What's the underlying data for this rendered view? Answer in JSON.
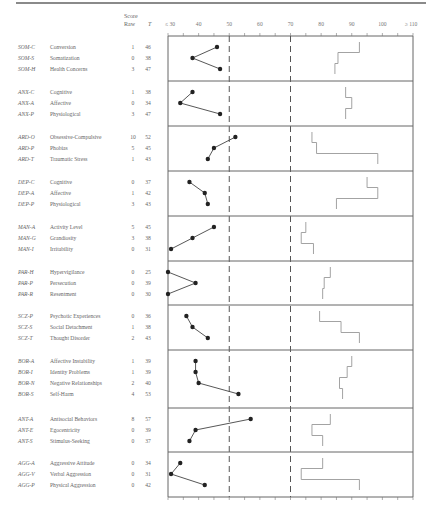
{
  "header": {
    "score_label": "Score",
    "raw_label": "Raw",
    "t_label": "T"
  },
  "axis": {
    "ticks": [
      {
        "value": 30,
        "label": "≤ 30"
      },
      {
        "value": 40,
        "label": "40"
      },
      {
        "value": 50,
        "label": "50"
      },
      {
        "value": 60,
        "label": "60"
      },
      {
        "value": 70,
        "label": "70"
      },
      {
        "value": 80,
        "label": "80"
      },
      {
        "value": 90,
        "label": "90"
      },
      {
        "value": 100,
        "label": "100"
      },
      {
        "value": 110,
        "label": "≥ 110"
      }
    ],
    "dashed_lines": [
      50,
      70
    ]
  },
  "sections": [
    {
      "rows": [
        {
          "abbr": "SOM-C",
          "name": "Conversion",
          "raw": "1",
          "t": "46",
          "ref": 92.5
        },
        {
          "abbr": "SOM-S",
          "name": "Somatization",
          "raw": "0",
          "t": "38",
          "ref": 85.5
        },
        {
          "abbr": "SOM-H",
          "name": "Health Concerns",
          "raw": "3",
          "t": "47",
          "ref": 84.5
        }
      ]
    },
    {
      "rows": [
        {
          "abbr": "ANX-C",
          "name": "Cognitive",
          "raw": "1",
          "t": "38",
          "ref": 88
        },
        {
          "abbr": "ANX-A",
          "name": "Affective",
          "raw": "0",
          "t": "34",
          "ref": 90
        },
        {
          "abbr": "ANX-P",
          "name": "Physiological",
          "raw": "3",
          "t": "47",
          "ref": 88
        }
      ]
    },
    {
      "rows": [
        {
          "abbr": "ARD-O",
          "name": "Obsessive-Compulsive",
          "raw": "10",
          "t": "52",
          "ref": 77
        },
        {
          "abbr": "ARD-P",
          "name": "Phobias",
          "raw": "5",
          "t": "45",
          "ref": 78.5
        },
        {
          "abbr": "ARD-T",
          "name": "Traumatic Stress",
          "raw": "1",
          "t": "43",
          "ref": 98.5
        }
      ]
    },
    {
      "rows": [
        {
          "abbr": "DEP-C",
          "name": "Cognitive",
          "raw": "0",
          "t": "37",
          "ref": 95
        },
        {
          "abbr": "DEP-A",
          "name": "Affective",
          "raw": "1",
          "t": "42",
          "ref": 98.5
        },
        {
          "abbr": "DEP-P",
          "name": "Physiological",
          "raw": "3",
          "t": "43",
          "ref": 85
        }
      ]
    },
    {
      "rows": [
        {
          "abbr": "MAN-A",
          "name": "Activity Level",
          "raw": "5",
          "t": "45",
          "ref": 75
        },
        {
          "abbr": "MAN-G",
          "name": "Grandiosity",
          "raw": "3",
          "t": "38",
          "ref": 73.5
        },
        {
          "abbr": "MAN-I",
          "name": "Irritability",
          "raw": "0",
          "t": "31",
          "ref": 77.5
        }
      ]
    },
    {
      "rows": [
        {
          "abbr": "PAR-H",
          "name": "Hypervigilance",
          "raw": "0",
          "t": "25",
          "ref": 83
        },
        {
          "abbr": "PAR-P",
          "name": "Persecution",
          "raw": "0",
          "t": "39",
          "ref": 81
        },
        {
          "abbr": "PAR-R",
          "name": "Resentment",
          "raw": "0",
          "t": "30",
          "ref": 80.5
        }
      ]
    },
    {
      "rows": [
        {
          "abbr": "SCZ-P",
          "name": "Psychotic Experiences",
          "raw": "0",
          "t": "36",
          "ref": 79.5
        },
        {
          "abbr": "SCZ-S",
          "name": "Social Detachment",
          "raw": "1",
          "t": "38",
          "ref": 86.5
        },
        {
          "abbr": "SCZ-T",
          "name": "Thought Disorder",
          "raw": "2",
          "t": "43",
          "ref": 92.5
        }
      ]
    },
    {
      "rows": [
        {
          "abbr": "BOR-A",
          "name": "Affective Instability",
          "raw": "1",
          "t": "39",
          "ref": 90
        },
        {
          "abbr": "BOR-I",
          "name": "Identity Problems",
          "raw": "1",
          "t": "39",
          "ref": 88.5
        },
        {
          "abbr": "BOR-N",
          "name": "Negative Relationships",
          "raw": "2",
          "t": "40",
          "ref": 86
        },
        {
          "abbr": "BOR-S",
          "name": "Self-Harm",
          "raw": "4",
          "t": "53",
          "ref": 87
        }
      ]
    },
    {
      "rows": [
        {
          "abbr": "ANT-A",
          "name": "Antisocial Behaviors",
          "raw": "8",
          "t": "57",
          "ref": 83
        },
        {
          "abbr": "ANT-E",
          "name": "Egocentricity",
          "raw": "0",
          "t": "39",
          "ref": 77
        },
        {
          "abbr": "ANT-S",
          "name": "Stimulus-Seeking",
          "raw": "0",
          "t": "37",
          "ref": 80.5
        }
      ]
    },
    {
      "rows": [
        {
          "abbr": "AGG-A",
          "name": "Aggressive Attitude",
          "raw": "0",
          "t": "34",
          "ref": 80.5
        },
        {
          "abbr": "AGG-V",
          "name": "Verbal Aggression",
          "raw": "0",
          "t": "31",
          "ref": 73.5
        },
        {
          "abbr": "AGG-P",
          "name": "Physical Aggression",
          "raw": "0",
          "t": "42",
          "ref": 92.5
        }
      ]
    }
  ],
  "chart_data": {
    "type": "line",
    "title": "",
    "xlabel": "T Score",
    "ylabel": "",
    "xlim": [
      30,
      110
    ],
    "x_tick_labels": [
      "≤ 30",
      "40",
      "50",
      "60",
      "70",
      "80",
      "90",
      "100",
      "≥ 110"
    ],
    "reference_lines": [
      50,
      70
    ],
    "grid": false,
    "orientation": "horizontal-profile",
    "categories": [
      "SOM-C",
      "SOM-S",
      "SOM-H",
      "ANX-C",
      "ANX-A",
      "ANX-P",
      "ARD-O",
      "ARD-P",
      "ARD-T",
      "DEP-C",
      "DEP-A",
      "DEP-P",
      "MAN-A",
      "MAN-G",
      "MAN-I",
      "PAR-H",
      "PAR-P",
      "PAR-R",
      "SCZ-P",
      "SCZ-S",
      "SCZ-T",
      "BOR-A",
      "BOR-I",
      "BOR-N",
      "BOR-S",
      "ANT-A",
      "ANT-E",
      "ANT-S",
      "AGG-A",
      "AGG-V",
      "AGG-P"
    ],
    "series": [
      {
        "name": "Client T score (line with points)",
        "values": [
          46,
          38,
          47,
          38,
          34,
          47,
          52,
          45,
          43,
          37,
          42,
          43,
          45,
          38,
          31,
          25,
          39,
          30,
          36,
          38,
          43,
          39,
          39,
          40,
          53,
          57,
          39,
          37,
          34,
          31,
          42
        ]
      },
      {
        "name": "Raw score",
        "values": [
          1,
          0,
          3,
          1,
          0,
          3,
          10,
          5,
          1,
          0,
          1,
          3,
          5,
          3,
          0,
          0,
          0,
          0,
          0,
          1,
          2,
          1,
          1,
          2,
          4,
          8,
          0,
          0,
          0,
          0,
          0
        ]
      },
      {
        "name": "Reference profile (step line)",
        "values": [
          92.5,
          85.5,
          84.5,
          88,
          90,
          88,
          77,
          78.5,
          98.5,
          95,
          98.5,
          85,
          75,
          73.5,
          77.5,
          83,
          81,
          80.5,
          79.5,
          86.5,
          92.5,
          90,
          88.5,
          86,
          87,
          83,
          77,
          80.5,
          80.5,
          73.5,
          92.5
        ]
      }
    ],
    "groups": [
      "SOM",
      "ANX",
      "ARD",
      "DEP",
      "MAN",
      "PAR",
      "SCZ",
      "BOR",
      "ANT",
      "AGG"
    ]
  }
}
